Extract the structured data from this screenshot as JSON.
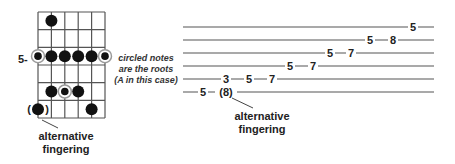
{
  "fretboard": {
    "strings": 6,
    "frets": 6,
    "grid": {
      "x0": 38,
      "x1": 105,
      "y0": 12,
      "y1": 118
    },
    "position_label": "5-",
    "position_row": 3,
    "notes": [
      {
        "string": 2,
        "row": 1,
        "root": false
      },
      {
        "string": 1,
        "row": 3,
        "root": true
      },
      {
        "string": 2,
        "row": 3,
        "root": false
      },
      {
        "string": 3,
        "row": 3,
        "root": false
      },
      {
        "string": 4,
        "row": 3,
        "root": false
      },
      {
        "string": 5,
        "row": 3,
        "root": false
      },
      {
        "string": 6,
        "row": 3,
        "root": true
      },
      {
        "string": 2,
        "row": 5,
        "root": false
      },
      {
        "string": 3,
        "row": 5,
        "root": true
      },
      {
        "string": 4,
        "row": 5,
        "root": false
      },
      {
        "string": 1,
        "row": 6,
        "root": false,
        "alternative": true
      },
      {
        "string": 5,
        "row": 6,
        "root": false
      }
    ],
    "annotation": {
      "line1": "circled notes",
      "line2": "are the roots",
      "line3": "(A in this case)"
    },
    "alt_label": {
      "line1": "alternative",
      "line2": "fingering"
    }
  },
  "tab": {
    "staff_lines": 6,
    "x0": 183,
    "x1": 434,
    "line_y": [
      27,
      40,
      53,
      66,
      79,
      92
    ],
    "notes": [
      {
        "line": 6,
        "x": 203,
        "text": "5"
      },
      {
        "line": 6,
        "x": 226,
        "text": "(8)"
      },
      {
        "line": 5,
        "x": 226,
        "text": "3"
      },
      {
        "line": 5,
        "x": 249,
        "text": "5"
      },
      {
        "line": 5,
        "x": 272,
        "text": "7"
      },
      {
        "line": 4,
        "x": 290,
        "text": "5"
      },
      {
        "line": 4,
        "x": 313,
        "text": "7"
      },
      {
        "line": 3,
        "x": 330,
        "text": "5"
      },
      {
        "line": 3,
        "x": 351,
        "text": "7"
      },
      {
        "line": 2,
        "x": 370,
        "text": "5"
      },
      {
        "line": 2,
        "x": 393,
        "text": "8"
      },
      {
        "line": 1,
        "x": 413,
        "text": "5"
      }
    ],
    "alt_label": {
      "line1": "alternative",
      "line2": "fingering"
    }
  },
  "colors": {
    "line": "#555555",
    "dot": "#111111",
    "ring": "#9a9a9a"
  }
}
